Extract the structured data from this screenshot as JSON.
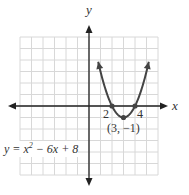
{
  "chart_data": {
    "type": "line",
    "title": "",
    "equation": "y = x² − 6x + 8",
    "xlabel": "x",
    "ylabel": "y",
    "xlim": [
      -6,
      6
    ],
    "ylim": [
      -6,
      6
    ],
    "grid": true,
    "series": [
      {
        "name": "y = x^2 - 6x + 8",
        "x": [
          0.8,
          1,
          1.5,
          2,
          2.5,
          3,
          3.5,
          4,
          4.5,
          5,
          5.2
        ],
        "y": [
          3.84,
          3,
          1.25,
          0,
          -0.75,
          -1,
          -0.75,
          0,
          1.25,
          3,
          3.84
        ]
      }
    ],
    "points": [
      {
        "x": 2,
        "y": 0,
        "label": "2"
      },
      {
        "x": 4,
        "y": 0,
        "label": "4"
      },
      {
        "x": 3,
        "y": -1,
        "label": "(3, −1)"
      }
    ]
  },
  "labels": {
    "x_axis": "x",
    "y_axis": "y",
    "root_left": "2",
    "root_right": "4",
    "vertex": "(3, −1)",
    "equation_prefix": "y = x",
    "equation_exp": "2",
    "equation_suffix": " − 6x + 8"
  },
  "colors": {
    "curve": "#444444",
    "axis": "#222222",
    "grid": "#d8d8d8"
  }
}
